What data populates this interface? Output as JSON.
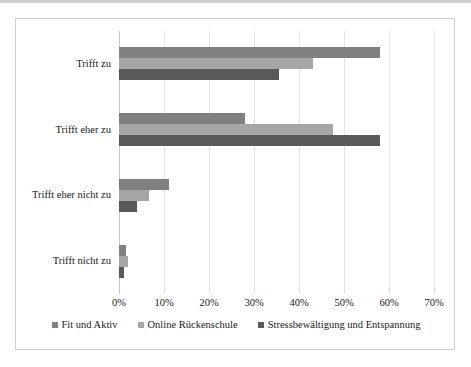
{
  "chart_data": {
    "type": "bar",
    "orientation": "horizontal",
    "title": "",
    "xlabel": "",
    "ylabel": "",
    "categories": [
      "Trifft zu",
      "Trifft eher zu",
      "Trifft eher nicht zu",
      "Trifft nicht zu"
    ],
    "series": [
      {
        "name": "Fit und Aktiv",
        "color": "#808080",
        "values": [
          58,
          28,
          11,
          1.5
        ]
      },
      {
        "name": "Online Rückenschule",
        "color": "#a6a6a6",
        "values": [
          43,
          47.5,
          6.7,
          2
        ]
      },
      {
        "name": "Stressbewältigung und Entspannung",
        "color": "#595959",
        "values": [
          35.5,
          58,
          4,
          1
        ]
      }
    ],
    "xlim": [
      0,
      70
    ],
    "xticks": [
      0,
      10,
      20,
      30,
      40,
      50,
      60,
      70
    ],
    "xtick_labels": [
      "0%",
      "10%",
      "20%",
      "30%",
      "40%",
      "50%",
      "60%",
      "70%"
    ],
    "grid": true,
    "grid_axis": "x",
    "legend_position": "bottom",
    "frame_border_color": "#d0d0d0",
    "gridline_color": "#e3e3e3"
  }
}
